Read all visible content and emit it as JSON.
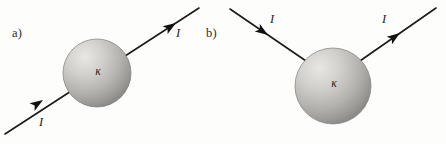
{
  "figure": {
    "background_color": "#fdfdfc",
    "ink_color": "#1a1a1a",
    "width": 446,
    "height": 144
  },
  "panels": [
    {
      "id": "a",
      "label": "a)",
      "sphere": {
        "symbol": "κ",
        "symbol_name": "kappa",
        "center_x": 97,
        "center_y": 73,
        "radius": 34,
        "fill_light": "#e4e2df",
        "fill_mid": "#b9b7b4",
        "fill_dark": "#8e8c89"
      },
      "arrows": [
        {
          "name": "current-arrow-a-outgoing",
          "label": "I",
          "direction": "up-right",
          "x1": 5,
          "y1": 134,
          "x2": 199,
          "y2": 8
        },
        {
          "name": "current-arrow-a-incoming",
          "label": "I",
          "direction": "up-right",
          "x1": 5,
          "y1": 134,
          "x2": 199,
          "y2": 8
        }
      ]
    },
    {
      "id": "b",
      "label": "b)",
      "sphere": {
        "symbol": "κ",
        "symbol_name": "kappa",
        "center_x": 333,
        "center_y": 86,
        "radius": 38,
        "fill_light": "#e4e2df",
        "fill_mid": "#b9b7b4",
        "fill_dark": "#8e8c89"
      },
      "arrows": [
        {
          "name": "current-arrow-b-incoming",
          "label": "I",
          "direction": "down-right",
          "x1": 230,
          "y1": 9,
          "x2": 308,
          "y2": 62
        },
        {
          "name": "current-arrow-b-outgoing",
          "label": "I",
          "direction": "up-right",
          "x1": 358,
          "y1": 62,
          "x2": 436,
          "y2": 8
        }
      ]
    }
  ],
  "labels": {
    "current": "I",
    "kappa": "κ",
    "panel_a": "a)",
    "panel_b": "b)"
  }
}
